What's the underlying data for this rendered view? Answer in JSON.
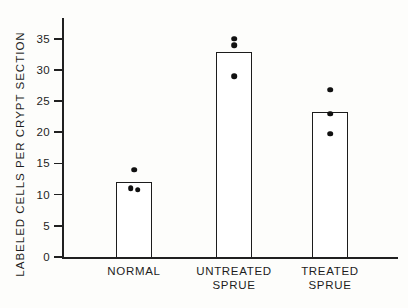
{
  "chart_data": {
    "type": "bar",
    "title": "",
    "xlabel": "",
    "ylabel": "LABELED CELLS PER CRYPT SECTION",
    "ylim": [
      0,
      38
    ],
    "yticks": [
      0,
      5,
      10,
      15,
      20,
      25,
      30,
      35
    ],
    "ytick_labels": [
      "0",
      "5",
      "10",
      "15",
      "20",
      "25",
      "30",
      "35"
    ],
    "grid": false,
    "legend": "none",
    "categories": [
      "NORMAL",
      "UNTREATED SPRUE",
      "TREATED SPRUE"
    ],
    "category_labels": [
      "NORMAL",
      "UNTREATED\nSPRUE",
      "TREATED\nSPRUE"
    ],
    "values": [
      12.0,
      32.8,
      23.2
    ],
    "series": [
      {
        "name": "Mean labeled cells per crypt section",
        "values": [
          12.0,
          32.8,
          23.2
        ]
      }
    ],
    "points": [
      {
        "category": "NORMAL",
        "values": [
          14.0,
          11.0,
          10.8
        ]
      },
      {
        "category": "UNTREATED SPRUE",
        "values": [
          35.0,
          34.0,
          29.0
        ]
      },
      {
        "category": "TREATED SPRUE",
        "values": [
          26.8,
          23.0,
          19.8
        ]
      }
    ],
    "colors": {
      "bar_fill": "#ffffff",
      "bar_edge": "#1c1c1c",
      "point": "#111111",
      "axis": "#202020",
      "background": "#fdfdfb"
    }
  }
}
